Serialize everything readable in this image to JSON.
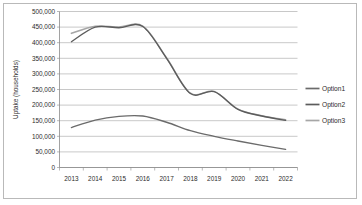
{
  "chart_data": {
    "type": "line",
    "title": "",
    "xlabel": "",
    "ylabel": "Uptake (households)",
    "categories": [
      "2013",
      "2014",
      "2015",
      "2016",
      "2017",
      "2018",
      "2019",
      "2020",
      "2021",
      "2022"
    ],
    "x": [
      2013,
      2014,
      2015,
      2016,
      2017,
      2018,
      2019,
      2020,
      2021,
      2022
    ],
    "ylim": [
      0,
      500000
    ],
    "ytick_values": [
      0,
      50000,
      100000,
      150000,
      200000,
      250000,
      300000,
      350000,
      400000,
      450000,
      500000
    ],
    "ytick_labels": [
      "0",
      "50,000",
      "100,000",
      "150,000",
      "200,000",
      "250,000",
      "300,000",
      "350,000",
      "400,000",
      "450,000",
      "500,000"
    ],
    "grid": true,
    "grid_axis": "y",
    "legend_position": "right",
    "smoothed": true,
    "series": [
      {
        "name": "Option1",
        "color": "#6b6b6b",
        "values": [
          128000,
          152000,
          164000,
          165000,
          145000,
          118000,
          100000,
          85000,
          71000,
          58000
        ]
      },
      {
        "name": "Option2",
        "color": "#5c5c5c",
        "values": [
          403000,
          450000,
          448000,
          452000,
          350000,
          237000,
          243000,
          186000,
          165000,
          151000
        ]
      },
      {
        "name": "Option3",
        "color": "#a6a6a6",
        "values": [
          430000,
          453000,
          450000,
          453000,
          351000,
          238000,
          244000,
          187000,
          166000,
          153000
        ]
      }
    ]
  },
  "legend": {
    "items": [
      {
        "label": "Option1"
      },
      {
        "label": "Option2"
      },
      {
        "label": "Option3"
      }
    ]
  },
  "axes": {
    "y_title": "Uptake (households)"
  },
  "colors": {
    "gridline": "#9a9a9a",
    "axis": "#8a8a8a",
    "text": "#2b2b2b",
    "frame": "#b9b9b9",
    "background": "#ffffff"
  }
}
